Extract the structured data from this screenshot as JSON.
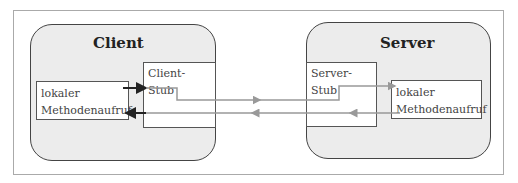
{
  "client": {
    "title": "Client",
    "stub": "Client-Stub",
    "local_line1": "lokaler",
    "local_line2": "Methodenaufruf"
  },
  "server": {
    "title": "Server",
    "stub": "Server-Stub",
    "local_line1": "lokaler",
    "local_line2": "Methodenaufruf"
  },
  "colors": {
    "node_fill": "#ececec",
    "arrow_dark": "#222222",
    "arrow_gray": "#999999"
  }
}
